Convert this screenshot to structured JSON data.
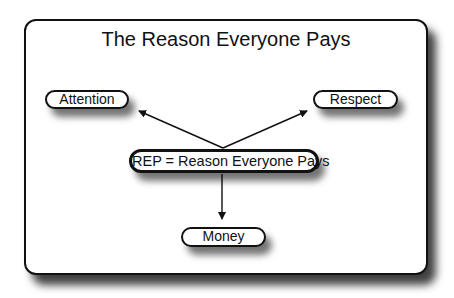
{
  "diagram": {
    "title": "The Reason Everyone Pays",
    "center_node": "REP = Reason Everyone Pays",
    "nodes": [
      {
        "id": "attention",
        "label": "Attention"
      },
      {
        "id": "respect",
        "label": "Respect"
      },
      {
        "id": "money",
        "label": "Money"
      }
    ],
    "edges": [
      {
        "from": "center",
        "to": "attention"
      },
      {
        "from": "center",
        "to": "respect"
      },
      {
        "from": "center",
        "to": "money"
      }
    ]
  }
}
